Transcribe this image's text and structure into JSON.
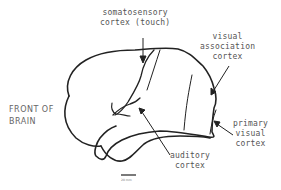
{
  "labels": {
    "somatosensory": [
      "somatosensory",
      "cortex (touch)"
    ],
    "visual_association": [
      "visual",
      "association",
      "cortex"
    ],
    "front": [
      "FRONT OF",
      "BRAIN"
    ],
    "primary_visual": [
      "primary",
      "visual",
      "cortex"
    ],
    "auditory": [
      "auditory",
      "cortex"
    ],
    "scale": "20 mm"
  }
}
